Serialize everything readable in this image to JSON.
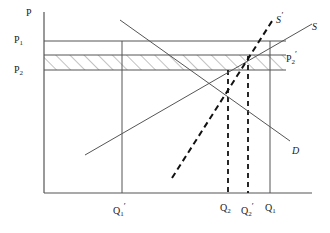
{
  "figure": {
    "type": "supply-demand-diagram",
    "axes": {
      "y_axis_label": "P",
      "x_axis_label": "",
      "origin": [
        44,
        193
      ],
      "y_top": 12,
      "x_right": 312
    },
    "colors": {
      "line": "#555555",
      "dashed": "#111111",
      "text": "#1a1a1a",
      "hatch": "#777777",
      "background": "#ffffff"
    }
  },
  "price_labels": [
    {
      "name": "p1",
      "text": "P",
      "sub": "1",
      "prime": "",
      "x": 14,
      "y": 35
    },
    {
      "name": "p2",
      "text": "P",
      "sub": "2",
      "prime": "",
      "x": 14,
      "y": 65
    },
    {
      "name": "p2-prime",
      "text": "P",
      "sub": "2",
      "prime": "′",
      "x": 286,
      "y": 51
    }
  ],
  "quantity_labels": [
    {
      "name": "q1-prime",
      "text": "Q",
      "sub": "1",
      "prime": "′",
      "x": 113,
      "y": 203
    },
    {
      "name": "q2",
      "text": "Q",
      "sub": "2",
      "prime": "",
      "x": 220,
      "y": 203
    },
    {
      "name": "q2-prime",
      "text": "Q",
      "sub": "2",
      "prime": "′",
      "x": 241,
      "y": 203
    },
    {
      "name": "q1",
      "text": "Q",
      "sub": "1",
      "prime": "",
      "x": 265,
      "y": 203
    }
  ],
  "curve_labels": [
    {
      "name": "supply-shifted",
      "text": "S",
      "prime": "′",
      "x": 276,
      "y": 12
    },
    {
      "name": "supply",
      "text": "S",
      "prime": "",
      "x": 312,
      "y": 22
    },
    {
      "name": "demand",
      "text": "D",
      "prime": "",
      "x": 292,
      "y": 146
    }
  ],
  "axis_title": {
    "text": "P",
    "x": 26,
    "y": 8
  },
  "chart_data": {
    "type": "line",
    "title": "",
    "xlabel": "",
    "ylabel": "P",
    "series": [
      {
        "name": "S",
        "style": "solid",
        "points": [
          [
            85,
            155
          ],
          [
            312,
            24
          ]
        ]
      },
      {
        "name": "S′",
        "style": "dashed",
        "points": [
          [
            172,
            178
          ],
          [
            274,
            18
          ]
        ]
      },
      {
        "name": "D",
        "style": "solid",
        "points": [
          [
            120,
            20
          ],
          [
            290,
            141
          ]
        ]
      }
    ],
    "horizontal_lines": [
      {
        "name": "P1",
        "y": 41,
        "x_from": 44,
        "x_to": 286
      },
      {
        "name": "P2-prime",
        "y": 55,
        "x_from": 44,
        "x_to": 286
      },
      {
        "name": "P2",
        "y": 70,
        "x_from": 44,
        "x_to": 286
      }
    ],
    "vertical_lines": [
      {
        "name": "Q1-prime",
        "x": 122,
        "style": "solid",
        "y_from": 41,
        "y_to": 193
      },
      {
        "name": "Q2",
        "x": 228,
        "style": "dashed",
        "y_from": 70,
        "y_to": 193
      },
      {
        "name": "Q2-prime",
        "x": 248,
        "style": "dashed",
        "y_from": 56,
        "y_to": 193
      },
      {
        "name": "Q1",
        "x": 270,
        "style": "solid",
        "y_from": 41,
        "y_to": 193
      }
    ],
    "shaded_regions": [
      {
        "name": "surplus-band",
        "fill": "hatch-diagonal",
        "x_from": 44,
        "x_to": 286,
        "y_from": 55,
        "y_to": 70
      }
    ],
    "grid": false,
    "legend": "inline-curve-labels"
  }
}
